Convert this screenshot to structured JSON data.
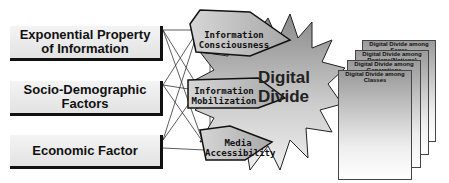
{
  "factors": [
    {
      "line1": "Exponential Property",
      "line2": "of Information"
    },
    {
      "line1": "Socio-Demographic",
      "line2": "Factors"
    },
    {
      "line1": "Economic Factor",
      "line2": ""
    }
  ],
  "mediators": [
    {
      "line1": "Information",
      "line2": "Consciousness"
    },
    {
      "line1": "Information",
      "line2": "Mobilization"
    },
    {
      "line1": "Media",
      "line2": "Accessibility"
    }
  ],
  "center": {
    "line1": "Digital",
    "line2": "Divide"
  },
  "outcomes": [
    {
      "line1": "Digital Divide among",
      "line2": "Sexes"
    },
    {
      "line1": "Digital Divide among",
      "line2": "Regions(Nations)"
    },
    {
      "line1": "Digital Divide among",
      "line2": "Generations"
    },
    {
      "line1": "Digital Divide among",
      "line2": "Classes"
    }
  ]
}
